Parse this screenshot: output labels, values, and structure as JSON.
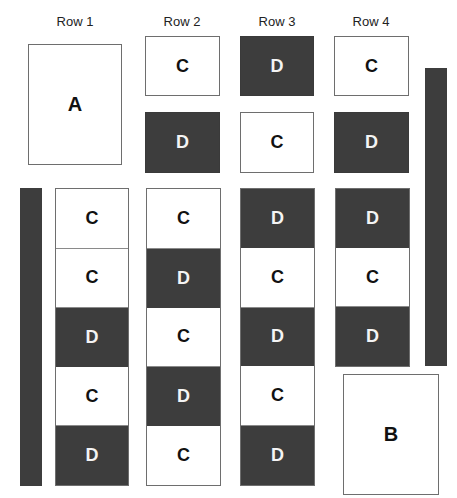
{
  "headers": [
    "Row 1",
    "Row 2",
    "Row 3",
    "Row 4"
  ],
  "colors": {
    "dark": "#3d3d3d",
    "light": "#ffffff",
    "border": "#6e6e6e"
  },
  "big_boxes": {
    "a": "A",
    "b": "B"
  },
  "top_blocks": {
    "row2": [
      "C",
      "D"
    ],
    "row3": [
      "D",
      "C"
    ],
    "row4": [
      "C",
      "D"
    ]
  },
  "columns": {
    "row1": [
      "C",
      "C",
      "D",
      "C",
      "D"
    ],
    "row2": [
      "C",
      "D",
      "C",
      "D",
      "C"
    ],
    "row3": [
      "D",
      "C",
      "D",
      "C",
      "D"
    ],
    "row4": [
      "D",
      "C",
      "D"
    ]
  }
}
